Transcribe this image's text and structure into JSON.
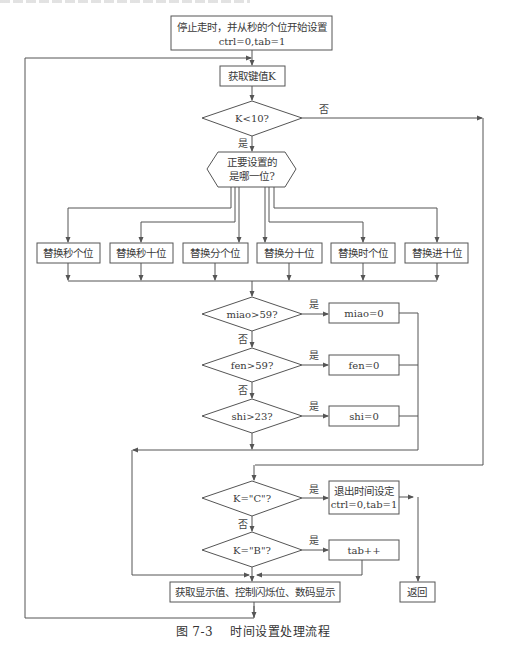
{
  "figure": {
    "caption_number": "图 7-3",
    "caption_title": "时间设置处理流程"
  },
  "nodes": {
    "start": {
      "line1": "停止走时，并从秒的个位开始设置",
      "line2": "ctrl=0,tab=1"
    },
    "get_key": {
      "label": "获取键值K"
    },
    "check_k_lt_10": {
      "label": "K<10?"
    },
    "which_digit": {
      "line1": "正要设置的",
      "line2": "是哪一位?"
    },
    "replace_boxes": [
      {
        "label": "替换秒个位"
      },
      {
        "label": "替换秒十位"
      },
      {
        "label": "替换分个位"
      },
      {
        "label": "替换分十位"
      },
      {
        "label": "替换时个位"
      },
      {
        "label": "替换进十位"
      }
    ],
    "check_miao": {
      "label": "miao>59?"
    },
    "set_miao": {
      "label": "miao=0"
    },
    "check_fen": {
      "label": "fen>59?"
    },
    "set_fen": {
      "label": "fen=0"
    },
    "check_shi": {
      "label": "shi>23?"
    },
    "set_shi": {
      "label": "shi=0"
    },
    "check_c": {
      "label": "K=\"C\"?"
    },
    "exit_setting": {
      "line1": "退出时间设定",
      "line2": "ctrl=0,tab=1"
    },
    "check_b": {
      "label": "K=\"B\"?"
    },
    "tab_inc": {
      "label": "tab++"
    },
    "display": {
      "label": "获取显示值、控制闪烁位、数码显示"
    },
    "return": {
      "label": "返回"
    }
  },
  "edge_labels": {
    "yes": "是",
    "no": "否"
  },
  "colors": {
    "line": "#555555",
    "text": "#3a3a3a",
    "background": "#ffffff"
  }
}
